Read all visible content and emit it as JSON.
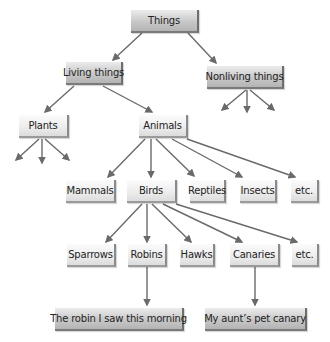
{
  "diagram": {
    "type": "hierarchy-tree",
    "colors": {
      "arrow": "#6a6a6a",
      "box_dark": "#c4c4c4",
      "box_light": "#ececec",
      "text": "#222222"
    },
    "nodes": {
      "things": "Things",
      "living_things": "Living things",
      "nonliving_things": "Nonliving things",
      "plants": "Plants",
      "animals": "Animals",
      "mammals": "Mammals",
      "birds": "Birds",
      "reptiles": "Reptiles",
      "insects": "Insects",
      "animals_etc": "etc.",
      "sparrows": "Sparrows",
      "robins": "Robins",
      "hawks": "Hawks",
      "canaries": "Canaries",
      "birds_etc": "etc.",
      "robin_instance": "The robin I saw this morning",
      "canary_instance": "My aunt’s pet canary"
    },
    "edges": [
      [
        "Things",
        "Living things"
      ],
      [
        "Things",
        "Nonliving things"
      ],
      [
        "Living things",
        "Plants"
      ],
      [
        "Living things",
        "Animals"
      ],
      [
        "Animals",
        "Mammals"
      ],
      [
        "Animals",
        "Birds"
      ],
      [
        "Animals",
        "Reptiles"
      ],
      [
        "Animals",
        "Insects"
      ],
      [
        "Animals",
        "etc."
      ],
      [
        "Birds",
        "Sparrows"
      ],
      [
        "Birds",
        "Robins"
      ],
      [
        "Birds",
        "Hawks"
      ],
      [
        "Birds",
        "Canaries"
      ],
      [
        "Birds",
        "etc."
      ],
      [
        "Robins",
        "The robin I saw this morning"
      ],
      [
        "Canaries",
        "My aunt’s pet canary"
      ]
    ],
    "open_branches": {
      "plants": 3,
      "nonliving_things": 3
    }
  }
}
